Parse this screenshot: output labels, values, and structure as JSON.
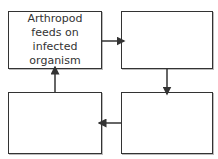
{
  "diagram": {
    "type": "cycle-flowchart",
    "boxes": [
      {
        "id": "top-left",
        "label": "Arthropod feeds on infected organism"
      },
      {
        "id": "top-right",
        "label": ""
      },
      {
        "id": "bottom-right",
        "label": ""
      },
      {
        "id": "bottom-left",
        "label": ""
      }
    ],
    "arrows": [
      {
        "from": "top-left",
        "to": "top-right"
      },
      {
        "from": "top-right",
        "to": "bottom-right"
      },
      {
        "from": "bottom-right",
        "to": "bottom-left"
      },
      {
        "from": "bottom-left",
        "to": "top-left"
      }
    ],
    "colors": {
      "stroke": "#333333",
      "fill": "#ffffff",
      "shadow": "#bbbbbb"
    }
  }
}
